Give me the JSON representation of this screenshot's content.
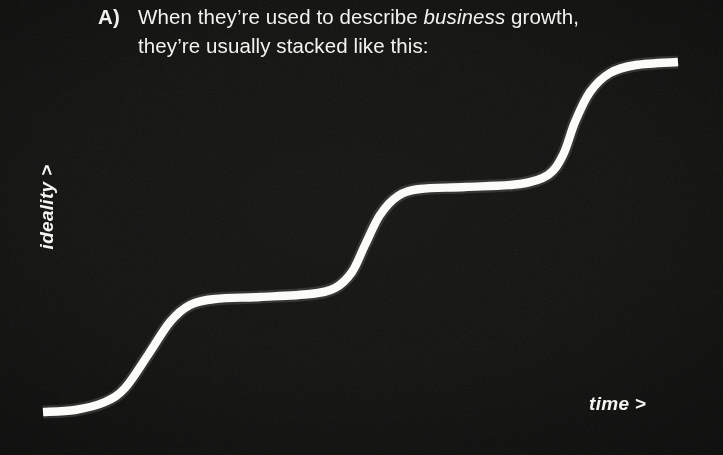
{
  "slide": {
    "width": 723,
    "height": 455,
    "background_color": "#0d0d0c",
    "ink_color": "#fbfbf7"
  },
  "caption": {
    "marker": "A)",
    "line1_before_italic": "When they’re used to describe ",
    "line1_italic": "business",
    "line1_after_italic": " growth,",
    "line2": "they’re usually stacked like this:",
    "full_text": "A) When they’re used to describe business growth, they’re usually stacked like this:"
  },
  "axes": {
    "y_label": "ideality >",
    "x_label": "time >"
  },
  "chart_data": {
    "type": "line",
    "xlabel": "time >",
    "ylabel": "ideality >",
    "grid": false,
    "legend": null,
    "axis_ticks": false,
    "xlim": [
      0,
      723
    ],
    "ylim": [
      455,
      0
    ],
    "note": "Three successive stacked sigmoid (S) curves, each new curve starting where the previous plateaus. Values are pixel coordinates read off the image; y decreases upward.",
    "series": [
      {
        "name": "stacked-s-curve",
        "stroke": "#fbfbf7",
        "stroke_width": 8.4,
        "points": [
          {
            "x": 43,
            "y": 412
          },
          {
            "x": 75,
            "y": 410
          },
          {
            "x": 105,
            "y": 402
          },
          {
            "x": 125,
            "y": 388
          },
          {
            "x": 148,
            "y": 355
          },
          {
            "x": 170,
            "y": 322
          },
          {
            "x": 190,
            "y": 305
          },
          {
            "x": 215,
            "y": 299
          },
          {
            "x": 260,
            "y": 297
          },
          {
            "x": 310,
            "y": 294
          },
          {
            "x": 335,
            "y": 288
          },
          {
            "x": 352,
            "y": 272
          },
          {
            "x": 365,
            "y": 245
          },
          {
            "x": 380,
            "y": 215
          },
          {
            "x": 398,
            "y": 196
          },
          {
            "x": 420,
            "y": 189
          },
          {
            "x": 465,
            "y": 187
          },
          {
            "x": 520,
            "y": 184
          },
          {
            "x": 548,
            "y": 175
          },
          {
            "x": 563,
            "y": 155
          },
          {
            "x": 575,
            "y": 122
          },
          {
            "x": 590,
            "y": 92
          },
          {
            "x": 610,
            "y": 73
          },
          {
            "x": 636,
            "y": 65
          },
          {
            "x": 678,
            "y": 62
          }
        ],
        "plateaus": [
          {
            "step": 1,
            "y": 411,
            "x_start": 43,
            "x_end": 100
          },
          {
            "step": 2,
            "y": 297,
            "x_start": 200,
            "x_end": 332
          },
          {
            "step": 3,
            "y": 187,
            "x_start": 422,
            "x_end": 545
          },
          {
            "step": 4,
            "y": 63,
            "x_start": 630,
            "x_end": 678
          }
        ],
        "inflections": [
          {
            "step": 1,
            "x": 148,
            "y": 355
          },
          {
            "step": 2,
            "x": 365,
            "y": 245
          },
          {
            "step": 3,
            "x": 575,
            "y": 122
          }
        ]
      }
    ]
  }
}
